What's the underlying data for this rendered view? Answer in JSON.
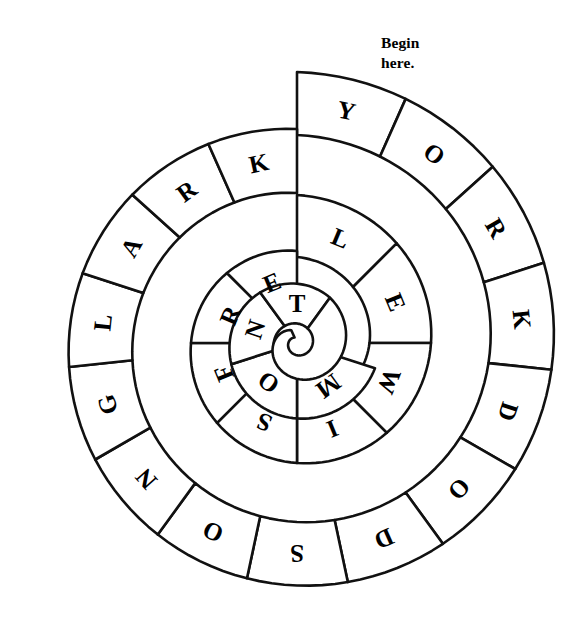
{
  "page": {
    "width": 568,
    "height": 644,
    "background": "#ffffff",
    "ink": "#111111"
  },
  "annotation": {
    "begin_text": "Begin\nhere.",
    "x": 381,
    "y": 33
  },
  "puzzle": {
    "type": "spiral-word-puzzle",
    "center_x": 297,
    "center_y": 343,
    "turns": 3,
    "solution_reading_outside_in": "YORKDODSONGLARKLEWISFREMONT",
    "solution_reading_inside_out": "TNOMERFSIWELKRALGNOSDODKROY",
    "letters_outside_in": [
      "Y",
      "O",
      "R",
      "K",
      "D",
      "O",
      "D",
      "S",
      "O",
      "N",
      "G",
      "L",
      "A",
      "R",
      "K",
      "L",
      "E",
      "W",
      "I",
      "S",
      "F",
      "R",
      "E",
      "M",
      "O",
      "N",
      "T"
    ],
    "rings": [
      {
        "name": "outer-ring",
        "index": 0,
        "cell_count": 15,
        "letters": [
          "Y",
          "O",
          "R",
          "K",
          "D",
          "O",
          "D",
          "S",
          "O",
          "N",
          "G",
          "L",
          "A",
          "R",
          "K"
        ],
        "start_angle_deg": -90,
        "sweep_deg": 360,
        "r_outer_start": 271,
        "r_outer_end": 214,
        "r_inner_start": 208,
        "r_inner_end": 150
      },
      {
        "name": "middle-ring",
        "index": 1,
        "cell_count": 8,
        "letters": [
          "L",
          "E",
          "W",
          "I",
          "S",
          "F",
          "R",
          "E"
        ],
        "start_angle_deg": -90,
        "sweep_deg": 360,
        "r_outer_start": 148,
        "r_outer_end": 92,
        "r_inner_start": 86,
        "r_inner_end": 32
      },
      {
        "name": "inner-ring",
        "index": 2,
        "cell_count": 4,
        "letters": [
          "M",
          "O",
          "N",
          "T"
        ],
        "start_angle_deg": 18,
        "sweep_deg": 288,
        "r_outer_start": 82,
        "r_outer_end": 56,
        "r_inner_start": 30,
        "r_inner_end": 18
      }
    ]
  }
}
